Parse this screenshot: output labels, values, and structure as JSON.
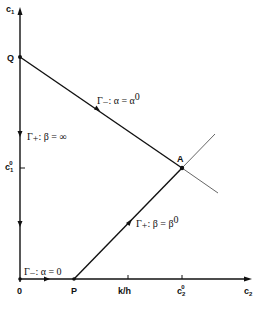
{
  "diagram": {
    "axes": {
      "x_label": "c",
      "x_label_sub": "2",
      "y_label": "c",
      "y_label_sub": "1",
      "origin_label": "0"
    },
    "points": {
      "Q": "Q",
      "A": "A",
      "P": "P"
    },
    "ticks": {
      "x": [
        {
          "label": "k/h"
        },
        {
          "label": "c",
          "sub": "2",
          "sup": "0"
        }
      ],
      "y": [
        {
          "label": "c",
          "sub": "1",
          "sup": "0"
        }
      ]
    },
    "curves": {
      "gamma_minus_alpha0": {
        "gamma": "Γ",
        "sign": "−",
        "text": ": α = α",
        "sup": "0"
      },
      "gamma_plus_beta_inf": {
        "gamma": "Γ",
        "sign": "+",
        "text": ": β = ∞"
      },
      "gamma_plus_beta0": {
        "gamma": "Γ",
        "sign": "+",
        "text": ": β = β",
        "sup": "0"
      },
      "gamma_minus_alpha_zero": {
        "gamma": "Γ",
        "sign": "−",
        "text": ": α = 0"
      }
    },
    "colors": {
      "line": "#111111",
      "light_line": "#555555"
    }
  }
}
